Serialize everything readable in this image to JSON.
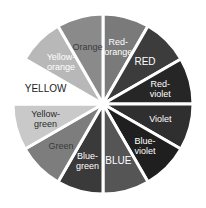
{
  "diagram": {
    "type": "color-wheel",
    "center": [
      103,
      104
    ],
    "radius": 90,
    "gap_color": "#ffffff",
    "segments": [
      {
        "name": "red-orange",
        "label_lines": [
          "Red-",
          "orange"
        ],
        "fill": "#7a7a7a",
        "text": "#ffffff",
        "start": 0,
        "end": 30
      },
      {
        "name": "red",
        "label_lines": [
          "RED"
        ],
        "fill": "#3c3c3c",
        "text": "#ffffff",
        "start": 30,
        "end": 60
      },
      {
        "name": "red-violet",
        "label_lines": [
          "Red-",
          "violet"
        ],
        "fill": "#262626",
        "text": "#ffffff",
        "start": 60,
        "end": 90
      },
      {
        "name": "violet",
        "label_lines": [
          "Violet"
        ],
        "fill": "#2f2f2f",
        "text": "#ffffff",
        "start": 90,
        "end": 120
      },
      {
        "name": "blue-violet",
        "label_lines": [
          "Blue-",
          "violet"
        ],
        "fill": "#1f1f1f",
        "text": "#ffffff",
        "start": 120,
        "end": 150
      },
      {
        "name": "blue",
        "label_lines": [
          "BLUE"
        ],
        "fill": "#555555",
        "text": "#ffffff",
        "start": 150,
        "end": 180
      },
      {
        "name": "blue-green",
        "label_lines": [
          "Blue-",
          "green"
        ],
        "fill": "#3a3a3a",
        "text": "#ffffff",
        "start": 180,
        "end": 210
      },
      {
        "name": "green",
        "label_lines": [
          "Green"
        ],
        "fill": "#7d7d7d",
        "text": "#3a3a3a",
        "start": 210,
        "end": 240
      },
      {
        "name": "yellow-green",
        "label_lines": [
          "Yellow-",
          "green"
        ],
        "fill": "#c9c9c9",
        "text": "#2a2a2a",
        "start": 240,
        "end": 270
      },
      {
        "name": "yellow",
        "label_lines": [
          "YELLOW"
        ],
        "fill": "#ffffff",
        "text": "#222222",
        "start": 270,
        "end": 300
      },
      {
        "name": "yellow-orange",
        "label_lines": [
          "Yellow-",
          "orange"
        ],
        "fill": "#b8b8b8",
        "text": "#ffffff",
        "start": 300,
        "end": 330
      },
      {
        "name": "orange",
        "label_lines": [
          "Orange"
        ],
        "fill": "#8a8a8a",
        "text": "#3a3a3a",
        "start": 330,
        "end": 360
      }
    ]
  }
}
